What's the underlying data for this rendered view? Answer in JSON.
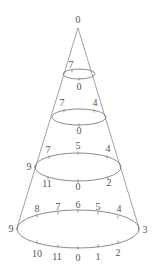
{
  "diagram": {
    "type": "cone-with-clock-ellipses",
    "apex": {
      "label": "0",
      "x": 78,
      "y": 28,
      "label_x": 78,
      "label_y": 23
    },
    "cone_edges": [
      {
        "x1": 78,
        "y1": 28,
        "x2": 17,
        "y2": 228
      },
      {
        "x1": 78,
        "y1": 28,
        "x2": 139,
        "y2": 228
      }
    ],
    "ellipses": [
      {
        "name": "level-1",
        "cx": 79,
        "cy": 74,
        "rx": 16,
        "ry": 5,
        "labels": [
          {
            "text": "7",
            "x": 71,
            "y": 68,
            "tx": 72,
            "ty": 71
          },
          {
            "text": "0",
            "x": 79,
            "y": 90,
            "tx": 79,
            "ty": 79
          }
        ]
      },
      {
        "name": "level-2",
        "cx": 79,
        "cy": 117,
        "rx": 27,
        "ry": 8,
        "labels": [
          {
            "text": "7",
            "x": 62,
            "y": 106,
            "tx": 64,
            "ty": 111
          },
          {
            "text": "4",
            "x": 95,
            "y": 106,
            "tx": 94,
            "ty": 111
          },
          {
            "text": "0",
            "x": 79,
            "y": 134,
            "tx": 79,
            "ty": 125
          }
        ]
      },
      {
        "name": "level-3",
        "cx": 78,
        "cy": 167,
        "rx": 43,
        "ry": 14,
        "labels": [
          {
            "text": "7",
            "x": 48,
            "y": 153,
            "tx": 49,
            "ty": 157
          },
          {
            "text": "5",
            "x": 78,
            "y": 149,
            "tx": 78,
            "ty": 153
          },
          {
            "text": "4",
            "x": 108,
            "y": 152,
            "tx": 107,
            "ty": 157
          },
          {
            "text": "9",
            "x": 29,
            "y": 170,
            "tx": 35,
            "ty": 167
          },
          {
            "text": "11",
            "x": 47,
            "y": 187,
            "tx": 48,
            "ty": 178
          },
          {
            "text": "0",
            "x": 78,
            "y": 190,
            "tx": 78,
            "ty": 181
          },
          {
            "text": "2",
            "x": 109,
            "y": 186,
            "tx": 108,
            "ty": 178
          }
        ]
      },
      {
        "name": "level-4",
        "cx": 78,
        "cy": 229,
        "rx": 61,
        "ry": 19,
        "labels": [
          {
            "text": "8",
            "x": 37,
            "y": 212,
            "tx": 37,
            "ty": 216
          },
          {
            "text": "7",
            "x": 58,
            "y": 210,
            "tx": 58,
            "ty": 213
          },
          {
            "text": "6",
            "x": 78,
            "y": 208,
            "tx": 78,
            "ty": 211
          },
          {
            "text": "5",
            "x": 98,
            "y": 210,
            "tx": 98,
            "ty": 213
          },
          {
            "text": "4",
            "x": 119,
            "y": 212,
            "tx": 118,
            "ty": 217
          },
          {
            "text": "9",
            "x": 11,
            "y": 232,
            "tx": 17,
            "ty": 229
          },
          {
            "text": "3",
            "x": 145,
            "y": 233,
            "tx": 139,
            "ty": 229
          },
          {
            "text": "10",
            "x": 37,
            "y": 257,
            "tx": 37,
            "ty": 242
          },
          {
            "text": "11",
            "x": 57,
            "y": 260,
            "tx": 58,
            "ty": 246
          },
          {
            "text": "0",
            "x": 78,
            "y": 261,
            "tx": 78,
            "ty": 248
          },
          {
            "text": "1",
            "x": 98,
            "y": 260,
            "tx": 98,
            "ty": 246
          },
          {
            "text": "2",
            "x": 118,
            "y": 256,
            "tx": 118,
            "ty": 242
          }
        ]
      }
    ]
  }
}
